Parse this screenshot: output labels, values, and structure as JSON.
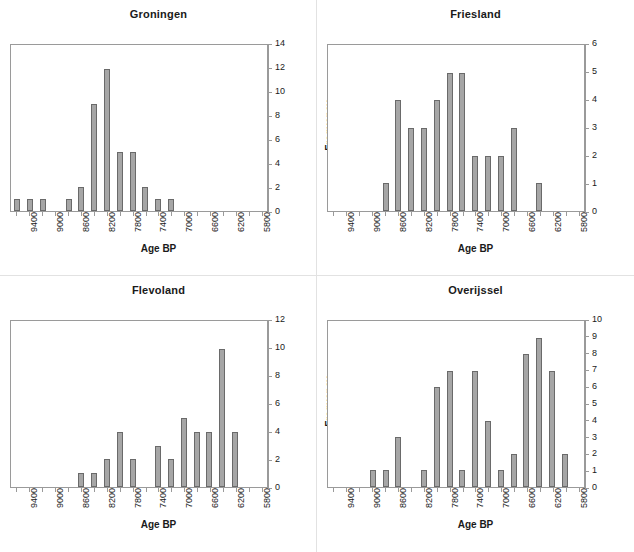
{
  "figure": {
    "panel_count": 4,
    "bar_color": "#a6a6a6",
    "bar_border_color": "#6a6a6a",
    "frame_color": "#9a9a9a",
    "background": "#ffffff"
  },
  "chart_data": [
    {
      "type": "bar",
      "title": "Groningen",
      "xlabel": "Age BP",
      "ylabel": "Frequency",
      "xlim": [
        9600,
        5800
      ],
      "ylim": [
        0,
        14
      ],
      "ytick_step": 2,
      "yticks": [
        0,
        2,
        4,
        6,
        8,
        10,
        12,
        14
      ],
      "xticks": [
        9600,
        9400,
        9200,
        9000,
        8800,
        8600,
        8400,
        8200,
        8000,
        7800,
        7600,
        7400,
        7200,
        7000,
        6800,
        6600,
        6400,
        6200,
        6000,
        5800
      ],
      "xticklabels": [
        "",
        "9400",
        "",
        "9000",
        "",
        "8600",
        "",
        "8200",
        "",
        "7800",
        "",
        "7400",
        "",
        "7000",
        "",
        "6600",
        "",
        "6200",
        "",
        "5800"
      ],
      "grid": false,
      "legend": false,
      "categories": [
        "9600",
        "9400",
        "9200",
        "9000",
        "8800",
        "8600",
        "8400",
        "8200",
        "8000",
        "7800",
        "7600",
        "7400",
        "7200",
        "7000",
        "6800",
        "6600",
        "6400",
        "6200",
        "6000",
        "5800"
      ],
      "values": [
        1,
        1,
        1,
        0,
        1,
        2,
        9,
        12,
        5,
        5,
        2,
        1,
        1,
        0,
        0,
        0,
        0,
        0,
        0,
        0
      ]
    },
    {
      "type": "bar",
      "title": "Friesland",
      "xlabel": "Age BP",
      "ylabel": "Frequency",
      "xlim": [
        9600,
        5800
      ],
      "ylim": [
        0,
        6
      ],
      "ytick_step": 1,
      "yticks": [
        0,
        1,
        2,
        3,
        4,
        5,
        6
      ],
      "xticks": [
        9600,
        9400,
        9200,
        9000,
        8800,
        8600,
        8400,
        8200,
        8000,
        7800,
        7600,
        7400,
        7200,
        7000,
        6800,
        6600,
        6400,
        6200,
        6000,
        5800
      ],
      "xticklabels": [
        "",
        "9400",
        "",
        "9000",
        "",
        "8600",
        "",
        "8200",
        "",
        "7800",
        "",
        "7400",
        "",
        "7000",
        "",
        "6600",
        "",
        "6200",
        "",
        "5800"
      ],
      "grid": false,
      "legend": false,
      "categories": [
        "9600",
        "9400",
        "9200",
        "9000",
        "8800",
        "8600",
        "8400",
        "8200",
        "8000",
        "7800",
        "7600",
        "7400",
        "7200",
        "7000",
        "6800",
        "6600",
        "6400",
        "6200",
        "6000",
        "5800"
      ],
      "values": [
        0,
        0,
        0,
        0,
        1,
        4,
        3,
        3,
        4,
        5,
        5,
        2,
        2,
        2,
        3,
        0,
        1,
        0,
        0,
        0
      ]
    },
    {
      "type": "bar",
      "title": "Flevoland",
      "xlabel": "Age BP",
      "ylabel": "Frequency",
      "xlim": [
        9600,
        5800
      ],
      "ylim": [
        0,
        12
      ],
      "ytick_step": 2,
      "yticks": [
        0,
        2,
        4,
        6,
        8,
        10,
        12
      ],
      "xticks": [
        9600,
        9400,
        9200,
        9000,
        8800,
        8600,
        8400,
        8200,
        8000,
        7800,
        7600,
        7400,
        7200,
        7000,
        6800,
        6600,
        6400,
        6200,
        6000,
        5800
      ],
      "xticklabels": [
        "",
        "9400",
        "",
        "9000",
        "",
        "8600",
        "",
        "8200",
        "",
        "7800",
        "",
        "7400",
        "",
        "7000",
        "",
        "6600",
        "",
        "6200",
        "",
        "5800"
      ],
      "grid": false,
      "legend": false,
      "categories": [
        "9600",
        "9400",
        "9200",
        "9000",
        "8800",
        "8600",
        "8400",
        "8200",
        "8000",
        "7800",
        "7600",
        "7400",
        "7200",
        "7000",
        "6800",
        "6600",
        "6400",
        "6200",
        "6000",
        "5800"
      ],
      "values": [
        0,
        0,
        0,
        0,
        0,
        1,
        1,
        2,
        4,
        2,
        0,
        3,
        2,
        5,
        4,
        4,
        10,
        4,
        0,
        0
      ]
    },
    {
      "type": "bar",
      "title": "Overijssel",
      "xlabel": "Age BP",
      "ylabel": "Frequency",
      "xlim": [
        9600,
        5800
      ],
      "ylim": [
        0,
        10
      ],
      "ytick_step": 1,
      "yticks": [
        0,
        1,
        2,
        3,
        4,
        5,
        6,
        7,
        8,
        9,
        10
      ],
      "xticks": [
        9600,
        9400,
        9200,
        9000,
        8800,
        8600,
        8400,
        8200,
        8000,
        7800,
        7600,
        7400,
        7200,
        7000,
        6800,
        6600,
        6400,
        6200,
        6000,
        5800
      ],
      "xticklabels": [
        "",
        "9400",
        "",
        "9000",
        "",
        "8600",
        "",
        "8200",
        "",
        "7800",
        "",
        "7400",
        "",
        "7000",
        "",
        "6600",
        "",
        "6200",
        "",
        "5800"
      ],
      "grid": false,
      "legend": false,
      "categories": [
        "9600",
        "9400",
        "9200",
        "9000",
        "8800",
        "8600",
        "8400",
        "8200",
        "8000",
        "7800",
        "7600",
        "7400",
        "7200",
        "7000",
        "6800",
        "6600",
        "6400",
        "6200",
        "6000",
        "5800"
      ],
      "values": [
        0,
        0,
        0,
        1,
        1,
        3,
        0,
        1,
        6,
        7,
        1,
        7,
        4,
        1,
        2,
        8,
        9,
        7,
        2,
        0
      ]
    }
  ]
}
